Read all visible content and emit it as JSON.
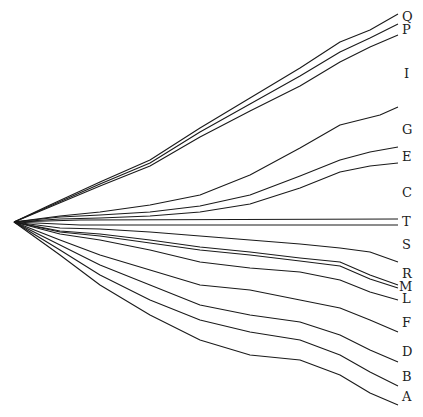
{
  "diagram": {
    "type": "diverging-trajectories",
    "origin": [
      14,
      222
    ],
    "line_color": "#1a1a1a",
    "lines": [
      {
        "label": "Q",
        "points": [
          [
            14,
            222
          ],
          [
            50,
            205
          ],
          [
            100,
            182
          ],
          [
            150,
            160
          ],
          [
            200,
            128
          ],
          [
            250,
            98
          ],
          [
            300,
            68
          ],
          [
            340,
            42
          ],
          [
            370,
            30
          ],
          [
            398,
            14
          ]
        ]
      },
      {
        "label": "P",
        "points": [
          [
            14,
            222
          ],
          [
            50,
            206
          ],
          [
            100,
            184
          ],
          [
            150,
            163
          ],
          [
            200,
            132
          ],
          [
            250,
            104
          ],
          [
            300,
            76
          ],
          [
            340,
            52
          ],
          [
            370,
            38
          ],
          [
            398,
            24
          ]
        ]
      },
      {
        "label": "I",
        "points": [
          [
            14,
            222
          ],
          [
            50,
            207
          ],
          [
            100,
            186
          ],
          [
            150,
            166
          ],
          [
            200,
            137
          ],
          [
            250,
            111
          ],
          [
            300,
            86
          ],
          [
            340,
            62
          ],
          [
            370,
            47
          ],
          [
            398,
            35
          ]
        ]
      },
      {
        "label": "G",
        "points": [
          [
            14,
            222
          ],
          [
            60,
            216
          ],
          [
            100,
            212
          ],
          [
            150,
            205
          ],
          [
            200,
            195
          ],
          [
            250,
            175
          ],
          [
            300,
            148
          ],
          [
            340,
            125
          ],
          [
            380,
            115
          ],
          [
            398,
            107
          ]
        ]
      },
      {
        "label": "E",
        "points": [
          [
            14,
            222
          ],
          [
            60,
            217
          ],
          [
            100,
            215
          ],
          [
            150,
            212
          ],
          [
            200,
            206
          ],
          [
            250,
            195
          ],
          [
            300,
            176
          ],
          [
            340,
            160
          ],
          [
            370,
            152
          ],
          [
            398,
            147
          ]
        ]
      },
      {
        "label": "C",
        "points": [
          [
            14,
            222
          ],
          [
            60,
            219
          ],
          [
            100,
            218
          ],
          [
            150,
            216
          ],
          [
            200,
            212
          ],
          [
            250,
            204
          ],
          [
            300,
            188
          ],
          [
            340,
            172
          ],
          [
            370,
            166
          ],
          [
            398,
            163
          ]
        ]
      },
      {
        "label": "T1",
        "points": [
          [
            14,
            222
          ],
          [
            80,
            220
          ],
          [
            398,
            219
          ]
        ]
      },
      {
        "label": "T2",
        "points": [
          [
            14,
            222
          ],
          [
            80,
            225
          ],
          [
            398,
            225
          ]
        ]
      },
      {
        "label": "S",
        "points": [
          [
            14,
            222
          ],
          [
            60,
            228
          ],
          [
            100,
            229
          ],
          [
            150,
            232
          ],
          [
            200,
            236
          ],
          [
            250,
            240
          ],
          [
            300,
            244
          ],
          [
            340,
            248
          ],
          [
            370,
            252
          ],
          [
            398,
            262
          ]
        ]
      },
      {
        "label": "R",
        "points": [
          [
            14,
            222
          ],
          [
            60,
            231
          ],
          [
            100,
            234
          ],
          [
            150,
            240
          ],
          [
            200,
            247
          ],
          [
            250,
            252
          ],
          [
            300,
            258
          ],
          [
            340,
            262
          ],
          [
            370,
            275
          ],
          [
            398,
            285
          ]
        ]
      },
      {
        "label": "M",
        "points": [
          [
            14,
            222
          ],
          [
            60,
            232
          ],
          [
            100,
            236
          ],
          [
            150,
            243
          ],
          [
            200,
            250
          ],
          [
            250,
            255
          ],
          [
            300,
            261
          ],
          [
            340,
            266
          ],
          [
            370,
            279
          ],
          [
            398,
            288
          ]
        ]
      },
      {
        "label": "L",
        "points": [
          [
            14,
            222
          ],
          [
            60,
            234
          ],
          [
            100,
            240
          ],
          [
            150,
            250
          ],
          [
            200,
            262
          ],
          [
            250,
            268
          ],
          [
            300,
            272
          ],
          [
            340,
            280
          ],
          [
            370,
            292
          ],
          [
            398,
            300
          ]
        ]
      },
      {
        "label": "F",
        "points": [
          [
            14,
            222
          ],
          [
            60,
            240
          ],
          [
            100,
            255
          ],
          [
            150,
            270
          ],
          [
            200,
            285
          ],
          [
            250,
            290
          ],
          [
            300,
            300
          ],
          [
            340,
            308
          ],
          [
            370,
            320
          ],
          [
            398,
            332
          ]
        ]
      },
      {
        "label": "D",
        "points": [
          [
            14,
            222
          ],
          [
            60,
            245
          ],
          [
            100,
            265
          ],
          [
            150,
            285
          ],
          [
            200,
            305
          ],
          [
            250,
            315
          ],
          [
            300,
            322
          ],
          [
            340,
            335
          ],
          [
            370,
            350
          ],
          [
            398,
            362
          ]
        ]
      },
      {
        "label": "B",
        "points": [
          [
            14,
            222
          ],
          [
            60,
            250
          ],
          [
            100,
            275
          ],
          [
            150,
            300
          ],
          [
            200,
            320
          ],
          [
            250,
            332
          ],
          [
            300,
            340
          ],
          [
            340,
            355
          ],
          [
            370,
            372
          ],
          [
            398,
            386
          ]
        ]
      },
      {
        "label": "A",
        "points": [
          [
            14,
            222
          ],
          [
            60,
            255
          ],
          [
            100,
            285
          ],
          [
            150,
            315
          ],
          [
            200,
            340
          ],
          [
            250,
            355
          ],
          [
            300,
            360
          ],
          [
            340,
            375
          ],
          [
            370,
            393
          ],
          [
            398,
            405
          ]
        ]
      }
    ],
    "labels": [
      {
        "text": "Q",
        "x": 402,
        "y": 10
      },
      {
        "text": "P",
        "x": 402,
        "y": 23
      },
      {
        "text": "I",
        "x": 404,
        "y": 67
      },
      {
        "text": "G",
        "x": 402,
        "y": 123
      },
      {
        "text": "E",
        "x": 402,
        "y": 150
      },
      {
        "text": "C",
        "x": 402,
        "y": 186
      },
      {
        "text": "T",
        "x": 402,
        "y": 215
      },
      {
        "text": "S",
        "x": 402,
        "y": 238
      },
      {
        "text": "R",
        "x": 402,
        "y": 267
      },
      {
        "text": "M",
        "x": 399,
        "y": 280
      },
      {
        "text": "L",
        "x": 402,
        "y": 292
      },
      {
        "text": "F",
        "x": 402,
        "y": 316
      },
      {
        "text": "D",
        "x": 402,
        "y": 345
      },
      {
        "text": "B",
        "x": 402,
        "y": 370
      },
      {
        "text": "A",
        "x": 402,
        "y": 390
      }
    ]
  }
}
